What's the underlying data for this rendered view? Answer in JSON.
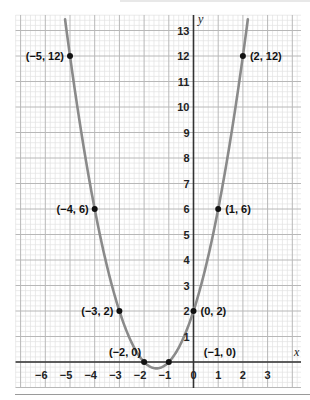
{
  "chart_data": {
    "type": "line",
    "title": "",
    "xlabel": "x",
    "ylabel": "y",
    "function": "y = x^2 + 3x + 2",
    "xlim": [
      -7,
      4.3
    ],
    "ylim": [
      -0.9,
      13.6
    ],
    "grid": true,
    "minor_grid_per_unit": 5,
    "x_ticks": [
      -6,
      -5,
      -4,
      -3,
      -2,
      -1,
      0,
      1,
      2,
      3
    ],
    "x_tick_labels": [
      "−6",
      "−5",
      "−4",
      "−3",
      "−2",
      "−1",
      "0",
      "1",
      "2",
      "3"
    ],
    "y_ticks": [
      1,
      2,
      3,
      4,
      5,
      6,
      7,
      8,
      9,
      10,
      11,
      12,
      13
    ],
    "y_tick_labels": [
      "1",
      "2",
      "3",
      "4",
      "5",
      "6",
      "7",
      "8",
      "9",
      "10",
      "11",
      "12",
      "13"
    ],
    "curve_x_range": [
      -5.2,
      2.2
    ],
    "points": [
      {
        "x": -5,
        "y": 12,
        "label": "(−5, 12)",
        "label_side": "left"
      },
      {
        "x": 2,
        "y": 12,
        "label": "(2, 12)",
        "label_side": "right"
      },
      {
        "x": -4,
        "y": 6,
        "label": "(−4, 6)",
        "label_side": "left"
      },
      {
        "x": 1,
        "y": 6,
        "label": "(1, 6)",
        "label_side": "right"
      },
      {
        "x": -3,
        "y": 2,
        "label": "(−3, 2)",
        "label_side": "left"
      },
      {
        "x": 0,
        "y": 2,
        "label": "(0, 2)",
        "label_side": "right"
      },
      {
        "x": -2,
        "y": 0,
        "label": "(−2, 0)",
        "label_side": "above-left"
      },
      {
        "x": -1,
        "y": 0,
        "label": "(−1, 0)",
        "label_side": "above-right"
      }
    ],
    "colors": {
      "curve": "#8a8a8a",
      "axis": "#333333",
      "major_grid": "#b8b8b8",
      "minor_grid": "#e2e2e2",
      "point": "#111111"
    }
  }
}
